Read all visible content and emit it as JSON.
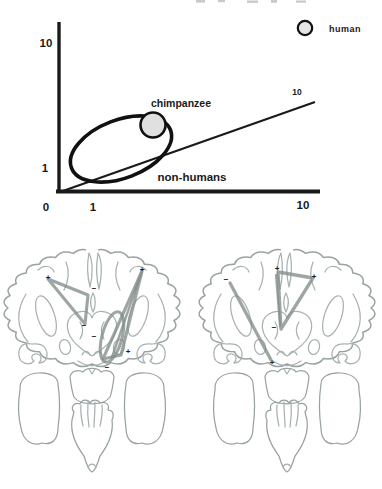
{
  "chart": {
    "axis": {
      "origin": "0",
      "x_ticks": [
        "1",
        "10"
      ],
      "y_ticks": [
        "1",
        "10"
      ]
    },
    "labels": {
      "chimpanzee": "chimpanzee",
      "non_humans": "non-humans",
      "diagonal_tick": "10"
    },
    "legend": {
      "label": "human"
    },
    "colors": {
      "axis": "#1a1a1a",
      "point_fill": "#e0e0e0",
      "ellipse_stroke": "#111111"
    }
  },
  "chart_data": {
    "type": "scatter",
    "title": "",
    "xlabel": "",
    "ylabel": "",
    "x_scale": "log-like, ticks at 1 and 10, origin labeled 0",
    "y_scale": "log-like, ticks at 1 and 10",
    "points": [
      {
        "label": "chimpanzee",
        "x": 1.9,
        "y": 2.2,
        "marker": "gray circle"
      }
    ],
    "legend": [
      {
        "label": "human",
        "marker": "gray circle (not plotted in axes)"
      }
    ],
    "regions": [
      {
        "label": "non-humans",
        "shape": "tilted ellipse",
        "x_center": 1.4,
        "y_center": 1.4
      }
    ],
    "reference_line": {
      "type": "identity diagonal from origin",
      "end_label": "10"
    },
    "grid": false,
    "legend_position": "top-right"
  },
  "brains": {
    "annotation_color": "#838d89",
    "outline_color": "#a9b1b1",
    "left": {
      "markers": [
        "+",
        "+",
        "−",
        "−",
        "−",
        "+",
        "−"
      ]
    },
    "right": {
      "markers": [
        "−",
        "+",
        "+",
        "−",
        "+"
      ]
    }
  }
}
